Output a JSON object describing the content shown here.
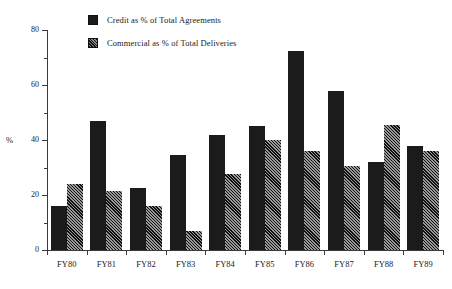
{
  "chart_data": {
    "type": "bar",
    "title": "",
    "subtitle": "",
    "xlabel": "",
    "ylabel": "%",
    "ylim": [
      0,
      80
    ],
    "yticks": [
      0,
      20,
      40,
      60,
      80
    ],
    "yticks_minor": [
      10,
      30,
      50,
      70
    ],
    "grid": false,
    "legend_position": "top-left",
    "categories": [
      "FY80",
      "FY81",
      "FY82",
      "FY83",
      "FY84",
      "FY85",
      "FY86",
      "FY87",
      "FY88",
      "FY89"
    ],
    "series": [
      {
        "name": "Credit as % of Total Agreements",
        "swatch": "solid",
        "color": "#1b1b1b",
        "values": [
          16,
          47,
          22.5,
          34.5,
          42,
          45,
          72.5,
          58,
          32,
          38
        ]
      },
      {
        "name": "Commercial as % of Total Deliveries",
        "swatch": "hatch",
        "color": "#303030",
        "values": [
          24,
          21.5,
          16,
          7,
          27.5,
          40,
          36,
          30.5,
          45.5,
          36
        ]
      }
    ]
  },
  "legend": {
    "items": [
      {
        "label": "Credit as % of Total Agreements",
        "swatch": "solid"
      },
      {
        "label": "Commercial as % of Total Deliveries",
        "swatch": "hatch"
      }
    ]
  },
  "axes": {
    "y_title": "%",
    "y_tick_labels": [
      "0",
      "20",
      "40",
      "60",
      "80"
    ],
    "x_tick_labels": [
      "FY80",
      "FY81",
      "FY82",
      "FY83",
      "FY84",
      "FY85",
      "FY86",
      "FY87",
      "FY88",
      "FY89"
    ]
  }
}
